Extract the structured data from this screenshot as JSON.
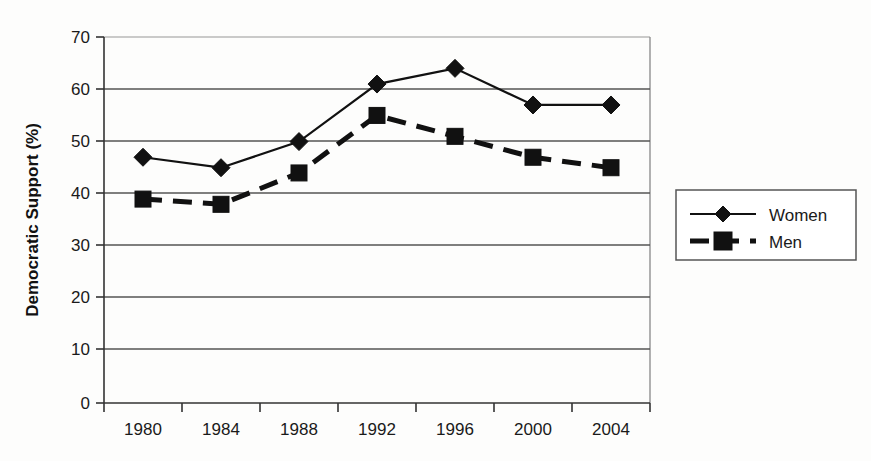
{
  "chart_data": {
    "type": "line",
    "title": "",
    "xlabel": "",
    "ylabel": "Democratic Support (%)",
    "categories": [
      "1980",
      "1984",
      "1988",
      "1992",
      "1996",
      "2000",
      "2004"
    ],
    "series": [
      {
        "name": "Women",
        "marker": "diamond",
        "linestyle": "solid",
        "color": "#111111",
        "values": [
          47,
          45,
          50,
          61,
          64,
          57,
          57
        ]
      },
      {
        "name": "Men",
        "marker": "square",
        "linestyle": "dashed",
        "color": "#111111",
        "values": [
          39,
          38,
          44,
          55,
          51,
          47,
          45
        ]
      }
    ],
    "ylim": [
      0,
      70
    ],
    "yticks": [
      0,
      10,
      20,
      30,
      40,
      50,
      60,
      70
    ],
    "ytick_labels": [
      "0",
      "10",
      "20",
      "30",
      "40",
      "50",
      "60",
      "70"
    ],
    "grid": "horizontal",
    "legend_position": "right-outside",
    "legend_entries": [
      "Women",
      "Men"
    ]
  },
  "axes": {
    "y_title": "Democratic Support (%)",
    "y_ticks": [
      "70",
      "60",
      "50",
      "40",
      "30",
      "20",
      "10",
      "0"
    ],
    "x_ticks": [
      "1980",
      "1984",
      "1988",
      "1992",
      "1996",
      "2000",
      "2004"
    ]
  },
  "legend": {
    "women_label": "Women",
    "men_label": "Men"
  },
  "colors": {
    "ink": "#111111",
    "grid": "#555555",
    "frame": "#888888",
    "background": "#fdfdfc"
  }
}
